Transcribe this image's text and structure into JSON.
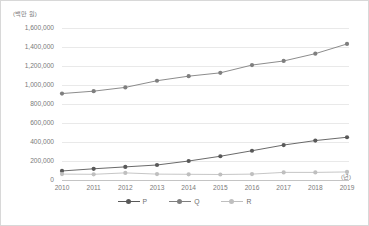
{
  "chart_data": {
    "type": "line",
    "title": "",
    "xlabel": "(년)",
    "ylabel": "(백만 원)",
    "x": [
      2010,
      2011,
      2012,
      2013,
      2014,
      2015,
      2016,
      2017,
      2018,
      2019
    ],
    "categories": [
      "2010",
      "2011",
      "2012",
      "2013",
      "2014",
      "2015",
      "2016",
      "2017",
      "2018",
      "2019"
    ],
    "ylim": [
      0,
      1600000
    ],
    "yticks": [
      0,
      200000,
      400000,
      600000,
      800000,
      1000000,
      1200000,
      1400000,
      1600000
    ],
    "ytick_labels": [
      "0",
      "200,000",
      "400,000",
      "600,000",
      "800,000",
      "1,000,000",
      "1,200,000",
      "1,400,000",
      "1,600,000"
    ],
    "grid": true,
    "legend_position": "bottom",
    "series": [
      {
        "name": "P",
        "color": "#595959",
        "values": [
          95000,
          118000,
          138000,
          158000,
          200000,
          250000,
          308000,
          368000,
          415000,
          450000
        ]
      },
      {
        "name": "Q",
        "color": "#7f7f7f",
        "values": [
          910000,
          935000,
          975000,
          1045000,
          1093000,
          1128000,
          1210000,
          1253000,
          1330000,
          1432000
        ]
      },
      {
        "name": "R",
        "color": "#bfbfbf",
        "values": [
          62000,
          60000,
          75000,
          62000,
          60000,
          58000,
          62000,
          80000,
          80000,
          85000
        ]
      }
    ]
  },
  "axis": {
    "y_unit": "(백만 원)",
    "x_unit": "(년)"
  },
  "legend": {
    "items": [
      {
        "label": "P"
      },
      {
        "label": "Q"
      },
      {
        "label": "R"
      }
    ]
  }
}
